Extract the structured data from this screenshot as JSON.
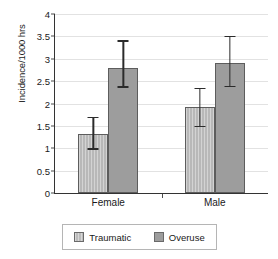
{
  "chart_data": {
    "type": "bar",
    "title": "",
    "xlabel": "",
    "ylabel": "Incidence/1000 hrs",
    "categories": [
      "Female",
      "Male"
    ],
    "ylim": [
      0,
      4
    ],
    "ytick_values": [
      0,
      0.5,
      1,
      1.5,
      2,
      2.5,
      3,
      3.5,
      4
    ],
    "ytick_labels": [
      "0",
      "0.5",
      "1",
      "1.5",
      "2",
      "2.5",
      "3",
      "3.5",
      "4"
    ],
    "grid": true,
    "legend_position": "bottom",
    "series": [
      {
        "name": "Traumatic",
        "color": "#b8b8b8",
        "values": [
          1.32,
          1.93
        ],
        "error_low": [
          1.0,
          1.5
        ],
        "error_high": [
          1.7,
          2.35
        ]
      },
      {
        "name": "Overuse",
        "color": "#9d9d9d",
        "values": [
          2.79,
          2.9
        ],
        "error_low": [
          2.38,
          2.4
        ],
        "error_high": [
          3.41,
          3.51
        ]
      }
    ]
  }
}
